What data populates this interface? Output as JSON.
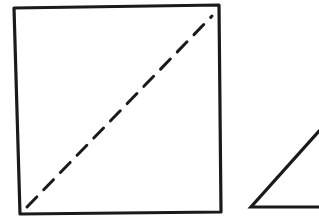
{
  "diagram": {
    "background": "#ffffff",
    "stroke_color": "#1a1a1a",
    "shapes": [
      {
        "id": "square",
        "type": "quadrilateral",
        "style": "solid",
        "stroke_width": 3.2,
        "points": [
          [
            14,
            8
          ],
          [
            219,
            5
          ],
          [
            221,
            212
          ],
          [
            20,
            214
          ]
        ]
      },
      {
        "id": "square-diagonal",
        "type": "line",
        "style": "dashed",
        "stroke_width": 3,
        "dash": "14 10",
        "from": [
          27,
          207
        ],
        "to": [
          212,
          16
        ]
      },
      {
        "id": "triangle",
        "type": "polyline",
        "style": "solid",
        "stroke_width": 3.2,
        "points": [
          [
            319,
            131
          ],
          [
            251,
            207
          ],
          [
            319,
            207
          ]
        ],
        "note": "partially visible, cropped at right edge"
      }
    ]
  }
}
